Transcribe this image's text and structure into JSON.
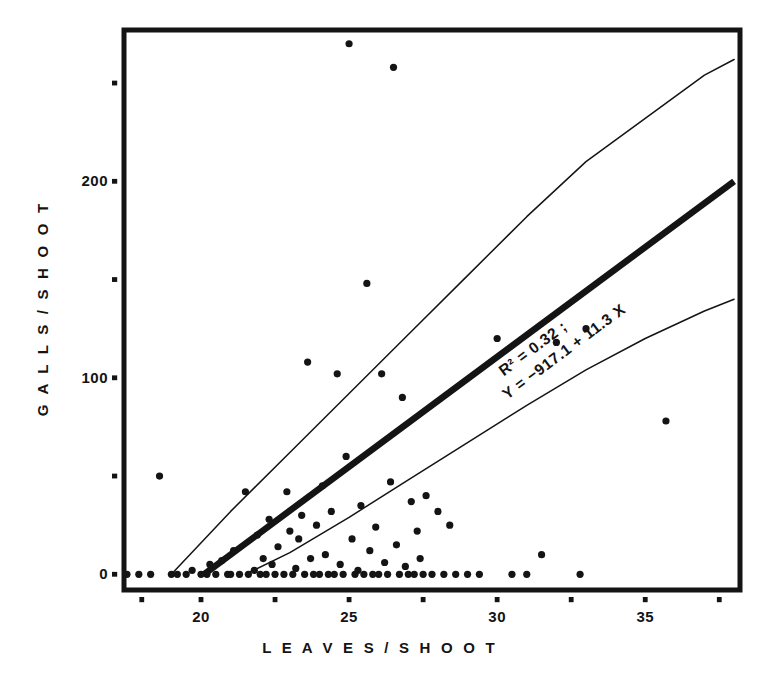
{
  "figure": {
    "background": "#ffffff",
    "ink_color": "#141414"
  },
  "axis": {
    "y_title": "G A L L S   /   S H O O T",
    "x_title": "L E A V E S   /   S H O O T",
    "y_tick_labels": [
      "0",
      "100",
      "200"
    ],
    "x_tick_labels": [
      "20",
      "25",
      "30",
      "35"
    ]
  },
  "annotation": {
    "r_squared": "R² = 0.32 ;",
    "equation": "Y = −917.1 + 11.3 X"
  },
  "chart_data": {
    "type": "scatter",
    "title": "",
    "xlabel": "LEAVES / SHOOT",
    "ylabel": "GALLS / SHOOT",
    "xlim": [
      17.4,
      38.2
    ],
    "ylim": [
      -8,
      277
    ],
    "grid": false,
    "legend": null,
    "x_ticks_major": [
      20,
      25,
      30,
      35
    ],
    "x_ticks_minor": [
      18,
      21.5,
      23.5,
      26.5,
      28.5,
      31.5,
      33.5,
      36.5
    ],
    "x_tick_all": [
      18,
      20,
      22.5,
      25,
      27.5,
      30,
      32.5,
      35,
      37.5
    ],
    "y_ticks_major": [
      0,
      100,
      200
    ],
    "y_ticks_minor": [
      50,
      150,
      250
    ],
    "y_tick_all": [
      0,
      50,
      100,
      150,
      200,
      250
    ],
    "regression": {
      "label": "Y = -917.1 + 11.3 X",
      "r_squared": 0.32,
      "intercept": -917.1,
      "slope": 11.3,
      "x_start": 20.1,
      "x_end": 38.0,
      "y_start": 0,
      "y_end": 200
    },
    "confidence_band_upper": {
      "x": [
        19.0,
        21.0,
        23.0,
        25.0,
        27.0,
        29.0,
        31.0,
        33.0,
        35.0,
        37.0,
        38.0
      ],
      "y": [
        0,
        32,
        62,
        92,
        122,
        152,
        182,
        210,
        232,
        254,
        262
      ]
    },
    "confidence_band_lower": {
      "x": [
        21.5,
        23.0,
        25.0,
        27.0,
        29.0,
        31.0,
        33.0,
        35.0,
        37.0,
        38.0
      ],
      "y": [
        0,
        11,
        29,
        48,
        67,
        86,
        104,
        120,
        134,
        140
      ]
    },
    "points": [
      [
        17.5,
        0
      ],
      [
        17.9,
        0
      ],
      [
        18.3,
        0
      ],
      [
        18.6,
        50
      ],
      [
        19.0,
        0
      ],
      [
        19.2,
        0
      ],
      [
        19.5,
        0
      ],
      [
        19.7,
        2
      ],
      [
        20.0,
        0
      ],
      [
        20.2,
        0
      ],
      [
        20.3,
        5
      ],
      [
        20.5,
        0
      ],
      [
        20.7,
        7
      ],
      [
        20.9,
        0
      ],
      [
        21.0,
        0
      ],
      [
        21.1,
        12
      ],
      [
        21.3,
        0
      ],
      [
        21.5,
        42
      ],
      [
        21.6,
        0
      ],
      [
        21.8,
        2
      ],
      [
        21.9,
        20
      ],
      [
        22.0,
        0
      ],
      [
        22.1,
        8
      ],
      [
        22.2,
        0
      ],
      [
        22.3,
        28
      ],
      [
        22.4,
        5
      ],
      [
        22.5,
        0
      ],
      [
        22.6,
        14
      ],
      [
        22.8,
        0
      ],
      [
        22.9,
        42
      ],
      [
        23.0,
        22
      ],
      [
        23.1,
        0
      ],
      [
        23.2,
        3
      ],
      [
        23.3,
        18
      ],
      [
        23.4,
        30
      ],
      [
        23.5,
        0
      ],
      [
        23.6,
        108
      ],
      [
        23.7,
        8
      ],
      [
        23.8,
        0
      ],
      [
        23.9,
        25
      ],
      [
        24.0,
        0
      ],
      [
        24.1,
        45
      ],
      [
        24.2,
        10
      ],
      [
        24.3,
        0
      ],
      [
        24.4,
        32
      ],
      [
        24.5,
        0
      ],
      [
        24.6,
        102
      ],
      [
        24.7,
        5
      ],
      [
        24.8,
        0
      ],
      [
        24.9,
        60
      ],
      [
        25.0,
        270
      ],
      [
        25.1,
        18
      ],
      [
        25.2,
        0
      ],
      [
        25.3,
        2
      ],
      [
        25.4,
        35
      ],
      [
        25.5,
        0
      ],
      [
        25.6,
        148
      ],
      [
        25.7,
        12
      ],
      [
        25.8,
        0
      ],
      [
        25.9,
        24
      ],
      [
        26.0,
        0
      ],
      [
        26.1,
        102
      ],
      [
        26.2,
        6
      ],
      [
        26.3,
        0
      ],
      [
        26.4,
        47
      ],
      [
        26.5,
        258
      ],
      [
        26.6,
        15
      ],
      [
        26.7,
        0
      ],
      [
        26.8,
        90
      ],
      [
        26.9,
        4
      ],
      [
        27.0,
        0
      ],
      [
        27.1,
        37
      ],
      [
        27.2,
        0
      ],
      [
        27.3,
        22
      ],
      [
        27.4,
        8
      ],
      [
        27.5,
        0
      ],
      [
        27.6,
        40
      ],
      [
        27.8,
        0
      ],
      [
        28.0,
        32
      ],
      [
        28.2,
        0
      ],
      [
        28.4,
        25
      ],
      [
        28.6,
        0
      ],
      [
        29.0,
        0
      ],
      [
        29.4,
        0
      ],
      [
        30.0,
        120
      ],
      [
        30.5,
        0
      ],
      [
        31.0,
        0
      ],
      [
        31.5,
        10
      ],
      [
        32.0,
        118
      ],
      [
        32.8,
        0
      ],
      [
        33.0,
        125
      ],
      [
        35.7,
        78
      ]
    ],
    "n_points_approx": 92
  }
}
